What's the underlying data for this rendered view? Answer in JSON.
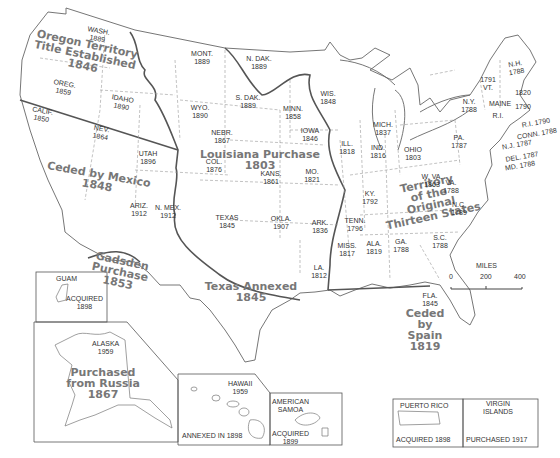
{
  "map": {
    "title": "Territorial growth of the United States",
    "colors": {
      "border": "#555555",
      "coast": "#666666",
      "state_line": "#999999",
      "region_text": "#777777",
      "label_text": "#333333"
    }
  },
  "regions": {
    "oregon": {
      "line1": "Oregon Territory",
      "line2": "Title Established",
      "year": "1846"
    },
    "louisiana": {
      "line1": "Louisiana Purchase",
      "year": "1803"
    },
    "mexico": {
      "line1": "Ceded by Mexico",
      "year": "1848"
    },
    "gadsden": {
      "line1": "Gadsden",
      "line2": "Purchase",
      "year": "1853"
    },
    "texas": {
      "line1": "Texas Annexed",
      "year": "1845"
    },
    "original": {
      "line1": "Territory",
      "line2": "of the",
      "line3": "Original",
      "line4": "Thirteen States"
    },
    "spain": {
      "line1": "Ceded",
      "line2": "by",
      "line3": "Spain",
      "year": "1819"
    },
    "russia": {
      "line1": "Purchased",
      "line2": "from Russia",
      "year": "1867"
    }
  },
  "states": [
    {
      "name": "WASH.",
      "year": "1889"
    },
    {
      "name": "OREG.",
      "year": "1859"
    },
    {
      "name": "CALIF.",
      "year": "1850"
    },
    {
      "name": "IDAHO",
      "year": "1890"
    },
    {
      "name": "NEV.",
      "year": "1864"
    },
    {
      "name": "MONT.",
      "year": "1889"
    },
    {
      "name": "WYO.",
      "year": "1890"
    },
    {
      "name": "UTAH",
      "year": "1896"
    },
    {
      "name": "ARIZ.",
      "year": "1912"
    },
    {
      "name": "N. MEX.",
      "year": "1912"
    },
    {
      "name": "COL.",
      "year": "1876"
    },
    {
      "name": "N. DAK.",
      "year": "1889"
    },
    {
      "name": "S. DAK.",
      "year": "1889"
    },
    {
      "name": "NEBR.",
      "year": "1867"
    },
    {
      "name": "KANS.",
      "year": "1861"
    },
    {
      "name": "OKLA.",
      "year": "1907"
    },
    {
      "name": "TEXAS",
      "year": "1845"
    },
    {
      "name": "MINN.",
      "year": "1858"
    },
    {
      "name": "IOWA",
      "year": "1846"
    },
    {
      "name": "MO.",
      "year": "1821"
    },
    {
      "name": "ARK.",
      "year": "1836"
    },
    {
      "name": "LA.",
      "year": "1812"
    },
    {
      "name": "WIS.",
      "year": "1848"
    },
    {
      "name": "ILL.",
      "year": "1818"
    },
    {
      "name": "MICH.",
      "year": "1837"
    },
    {
      "name": "IND.",
      "year": "1816"
    },
    {
      "name": "OHIO",
      "year": "1803"
    },
    {
      "name": "KY.",
      "year": "1792"
    },
    {
      "name": "TENN.",
      "year": "1796"
    },
    {
      "name": "MISS.",
      "year": "1817"
    },
    {
      "name": "ALA.",
      "year": "1819"
    },
    {
      "name": "GA.",
      "year": "1788"
    },
    {
      "name": "FLA.",
      "year": "1845"
    },
    {
      "name": "S.C.",
      "year": "1788"
    },
    {
      "name": "N.C.",
      "year": "1789"
    },
    {
      "name": "VA.",
      "year": "1788"
    },
    {
      "name": "W. VA.",
      "year": "1863"
    },
    {
      "name": "PA.",
      "year": "1787"
    },
    {
      "name": "N.Y.",
      "year": "1788"
    },
    {
      "name": "VT.",
      "year": "1791"
    },
    {
      "name": "N.H.",
      "year": "1788"
    },
    {
      "name": "MAINE",
      "year": "1820"
    },
    {
      "name": "MASS.",
      "year": "1788"
    },
    {
      "name": "R.I.",
      "year": "1790"
    },
    {
      "name": "CONN.",
      "year": "1788"
    },
    {
      "name": "N.J.",
      "year": "1787"
    },
    {
      "name": "DEL.",
      "year": "1787"
    },
    {
      "name": "MD.",
      "year": "1788"
    }
  ],
  "insets": {
    "guam": {
      "name": "GUAM",
      "line1": "ACQUIRED",
      "year": "1898"
    },
    "alaska": {
      "name": "ALASKA",
      "year": "1959"
    },
    "hawaii": {
      "name": "HAWAII",
      "year": "1959",
      "note": "ANNEXED IN 1898"
    },
    "samoa": {
      "name1": "AMERICAN",
      "name2": "SAMOA",
      "line1": "ACQUIRED",
      "year": "1899"
    },
    "puerto_rico": {
      "name": "PUERTO RICO",
      "note": "ACQUIRED 1898"
    },
    "virgin_islands": {
      "name1": "VIRGIN",
      "name2": "ISLANDS",
      "note": "PURCHASED 1917"
    }
  },
  "scale": {
    "title": "MILES",
    "ticks": [
      "0",
      "200",
      "400"
    ]
  }
}
